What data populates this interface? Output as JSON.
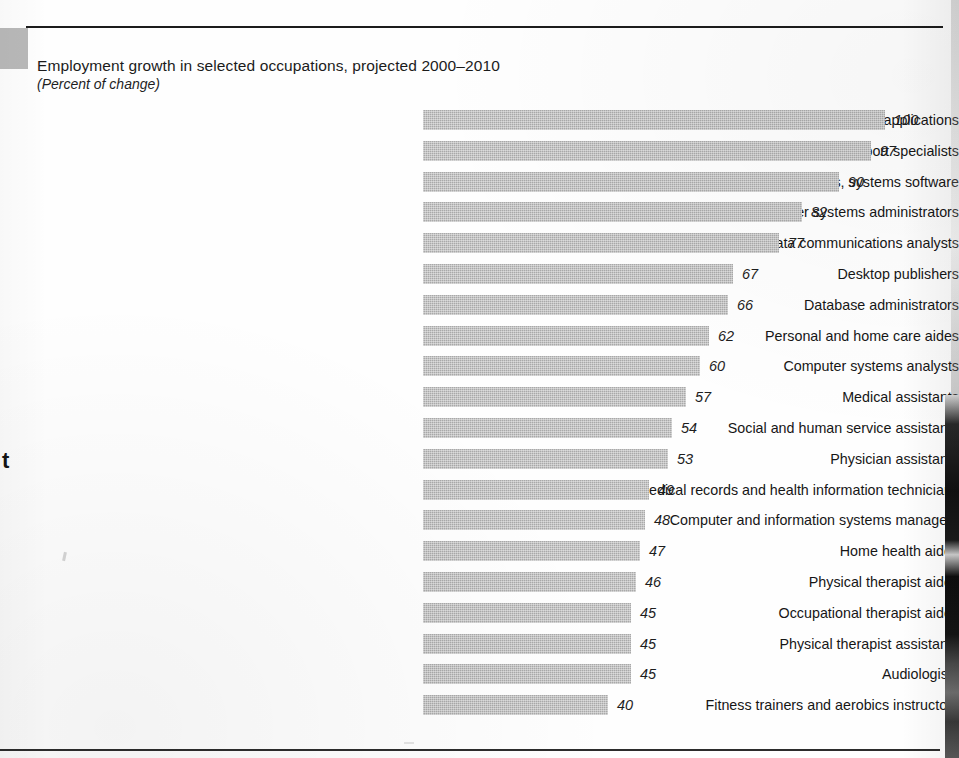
{
  "figure": {
    "title": "Employment growth in selected occupations, projected 2000–2010",
    "subtitle": "(Percent of change)"
  },
  "chart_data": {
    "type": "bar",
    "orientation": "horizontal",
    "title": "Employment growth in selected occupations, projected 2000–2010",
    "subtitle": "(Percent of change)",
    "xlabel": "",
    "ylabel": "",
    "units": "percent change",
    "grid": false,
    "legend": "none",
    "xlim": [
      0,
      100
    ],
    "categories": [
      "Computer software engineers, applications",
      "Computer support specialists",
      "Computer software engineers, systems software",
      "Network and computer systems administrators",
      "Network systems and data communications analysts",
      "Desktop publishers",
      "Database administrators",
      "Personal and home care aides",
      "Computer systems analysts",
      "Medical assistants",
      "Social and human service assistants",
      "Physician assistants",
      "Medical records and health information technicians",
      "Computer and information systems managers",
      "Home health aides",
      "Physical therapist aides",
      "Occupational therapist aides",
      "Physical therapist assistants",
      "Audiologists",
      "Fitness trainers and aerobics instructors"
    ],
    "values": [
      100,
      97,
      90,
      82,
      77,
      67,
      66,
      62,
      60,
      57,
      54,
      53,
      49,
      48,
      47,
      46,
      45,
      45,
      45,
      40
    ],
    "value_labels": [
      "100",
      "97",
      "90",
      "82",
      "77",
      "67",
      "66",
      "62",
      "60",
      "57",
      "54",
      "53",
      "49",
      "48",
      "47",
      "46",
      "45",
      "45",
      "45",
      "40"
    ],
    "bar_color": "#acacac",
    "text_color": "#161616"
  }
}
